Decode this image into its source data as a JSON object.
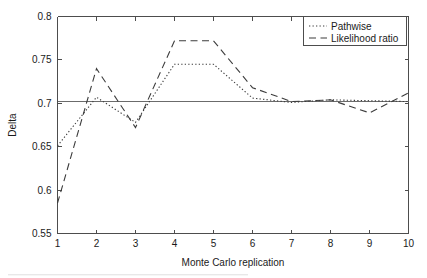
{
  "figure": {
    "background_color": "#ffffff",
    "axis_color": "#4d4d4d",
    "series_color": "#3c3c3c",
    "reference_color": "#6b6b6b"
  },
  "chart_data": {
    "type": "line",
    "title": "",
    "xlabel": "Monte Carlo replication",
    "ylabel": "Delta",
    "x": [
      1,
      2,
      3,
      4,
      5,
      6,
      7,
      8,
      9,
      10
    ],
    "xlim": [
      1,
      10
    ],
    "ylim": [
      0.55,
      0.8
    ],
    "xticks": [
      1,
      2,
      3,
      4,
      5,
      6,
      7,
      8,
      9,
      10
    ],
    "xtick_labels": [
      "1",
      "2",
      "3",
      "4",
      "5",
      "6",
      "7",
      "8",
      "9",
      "10"
    ],
    "yticks": [
      0.55,
      0.6,
      0.65,
      0.7,
      0.75,
      0.8
    ],
    "ytick_labels": [
      "0.55",
      "0.6",
      "0.65",
      "0.7",
      "0.75",
      "0.8"
    ],
    "grid": false,
    "legend_position": "upper right",
    "reference_line": {
      "name": "true-delta",
      "value": 0.702,
      "orientation": "horizontal"
    },
    "series": [
      {
        "name": "Pathwise",
        "linestyle": "dotted",
        "values": [
          0.651,
          0.707,
          0.678,
          0.745,
          0.745,
          0.706,
          0.701,
          0.704,
          0.703,
          0.702
        ]
      },
      {
        "name": "Likelihood ratio",
        "linestyle": "dashed",
        "values": [
          0.585,
          0.74,
          0.672,
          0.772,
          0.772,
          0.718,
          0.702,
          0.704,
          0.689,
          0.712
        ]
      }
    ]
  },
  "legend": {
    "entries": [
      {
        "label": "Pathwise"
      },
      {
        "label": "Likelihood ratio"
      }
    ]
  }
}
